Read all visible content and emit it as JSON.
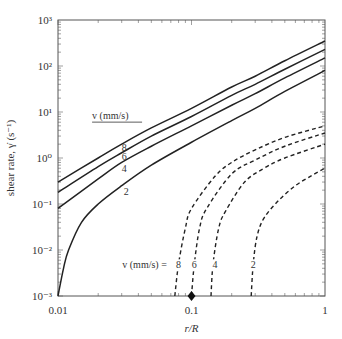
{
  "chart_data": {
    "type": "line",
    "title": "",
    "xlabel": "r/R",
    "ylabel": "shear rate, γ̇ (s⁻¹)",
    "xscale": "log",
    "yscale": "log",
    "xlim": [
      0.01,
      1
    ],
    "ylim": [
      0.001,
      1000
    ],
    "x_ticks": [
      "0.01",
      "0.1",
      "1"
    ],
    "y_ticks": [
      "10⁻³",
      "10⁻²",
      "10⁻¹",
      "10⁰",
      "10¹",
      "10²",
      "10³"
    ],
    "grid": false,
    "legend": "inline labels",
    "annotations": {
      "solid_group_label": "v (mm/s)",
      "dashed_group_label": "v (mm/s) =",
      "marker": {
        "x": 0.1,
        "y": 0.001,
        "shape": "diamond"
      }
    },
    "series": [
      {
        "name": "v=8 (solid)",
        "style": "solid",
        "label": "8",
        "x": [
          0.01,
          0.02,
          0.03,
          0.05,
          0.1,
          0.2,
          0.3,
          0.5,
          1
        ],
        "y": [
          0.3,
          1.0,
          2.0,
          4.5,
          12,
          35,
          60,
          130,
          350
        ]
      },
      {
        "name": "v=6 (solid)",
        "style": "solid",
        "label": "6",
        "x": [
          0.01,
          0.02,
          0.03,
          0.05,
          0.1,
          0.2,
          0.3,
          0.5,
          1
        ],
        "y": [
          0.18,
          0.65,
          1.3,
          3.0,
          8,
          23,
          40,
          85,
          230
        ]
      },
      {
        "name": "v=4 (solid)",
        "style": "solid",
        "label": "4",
        "x": [
          0.01,
          0.02,
          0.03,
          0.05,
          0.1,
          0.2,
          0.3,
          0.5,
          1
        ],
        "y": [
          0.08,
          0.35,
          0.8,
          1.8,
          5,
          14,
          25,
          55,
          150
        ]
      },
      {
        "name": "v=2 (solid)",
        "style": "solid",
        "label": "2",
        "x": [
          0.01,
          0.011,
          0.012,
          0.015,
          0.02,
          0.03,
          0.05,
          0.1,
          0.2,
          0.3,
          0.5,
          1
        ],
        "y": [
          0.001,
          0.004,
          0.01,
          0.04,
          0.1,
          0.25,
          0.7,
          2.2,
          6.5,
          12,
          28,
          80
        ]
      },
      {
        "name": "v=8 (dashed)",
        "style": "dashed",
        "label": "8",
        "x": [
          0.075,
          0.08,
          0.09,
          0.1,
          0.15,
          0.2,
          0.3,
          0.5,
          1
        ],
        "y": [
          0.001,
          0.005,
          0.03,
          0.08,
          0.4,
          0.8,
          1.5,
          2.8,
          5
        ]
      },
      {
        "name": "v=6 (dashed)",
        "style": "dashed",
        "label": "6",
        "x": [
          0.1,
          0.105,
          0.115,
          0.13,
          0.2,
          0.3,
          0.5,
          1
        ],
        "y": [
          0.001,
          0.005,
          0.03,
          0.08,
          0.45,
          0.9,
          1.8,
          3.5
        ]
      },
      {
        "name": "v=4 (dashed)",
        "style": "dashed",
        "label": "4",
        "x": [
          0.14,
          0.145,
          0.16,
          0.18,
          0.25,
          0.35,
          0.5,
          1
        ],
        "y": [
          0.001,
          0.005,
          0.03,
          0.07,
          0.3,
          0.6,
          1.0,
          2.0
        ]
      },
      {
        "name": "v=2 (dashed)",
        "style": "dashed",
        "label": "2",
        "x": [
          0.28,
          0.29,
          0.31,
          0.35,
          0.45,
          0.6,
          0.8,
          1
        ],
        "y": [
          0.001,
          0.005,
          0.02,
          0.05,
          0.12,
          0.25,
          0.42,
          0.6
        ]
      }
    ]
  },
  "labels": {
    "ylabel": "shear rate, γ̇ (s⁻¹)",
    "xlabel": "r/R",
    "solid_group": "v (mm/s)",
    "dashed_group": "v (mm/s) ="
  }
}
